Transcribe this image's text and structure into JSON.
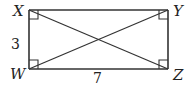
{
  "diagram": {
    "type": "rectangle-with-diagonals",
    "vertices": {
      "X": {
        "label": "X",
        "position": "top-left"
      },
      "Y": {
        "label": "Y",
        "position": "top-right"
      },
      "W": {
        "label": "W",
        "position": "bottom-left"
      },
      "Z": {
        "label": "Z",
        "position": "bottom-right"
      }
    },
    "side_labels": {
      "XW": "3",
      "WZ": "7"
    },
    "right_angle_markers": [
      "X",
      "Y",
      "W",
      "Z"
    ],
    "diagonals": [
      "XZ",
      "WY"
    ],
    "stroke_color": "#333333"
  }
}
